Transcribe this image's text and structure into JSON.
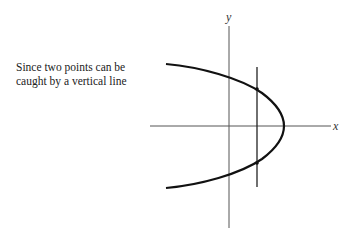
{
  "caption": {
    "line1": "Since two points can be",
    "line2": "caught by a vertical line"
  },
  "diagram": {
    "x_axis_label": "x",
    "y_axis_label": "y",
    "curve": "parabola opening left",
    "vertical_line": "intersects curve at two points",
    "colors": {
      "ink": "#111111",
      "axis": "#555555"
    }
  }
}
